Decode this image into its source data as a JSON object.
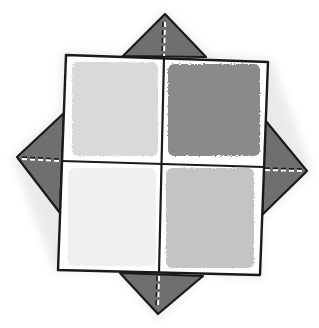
{
  "diagram": {
    "colors": {
      "background": "#ffffff",
      "outline": "#1a1a1a",
      "flap_fill": "#6f6f6f",
      "halo": "#e4e4e4",
      "quadrant_top_left": "#d9d9d9",
      "quadrant_top_right": "#8a8a8a",
      "quadrant_bottom_left": "#f0f0f0",
      "quadrant_bottom_right": "#c4c4c4",
      "fold_line_dashed": "#ffffff"
    },
    "parts": [
      {
        "name": "top-flap",
        "shape": "triangle"
      },
      {
        "name": "bottom-flap",
        "shape": "triangle"
      },
      {
        "name": "left-flap",
        "shape": "triangle"
      },
      {
        "name": "right-flap",
        "shape": "triangle"
      },
      {
        "name": "center-square",
        "shape": "square",
        "divisions": 4
      }
    ]
  }
}
